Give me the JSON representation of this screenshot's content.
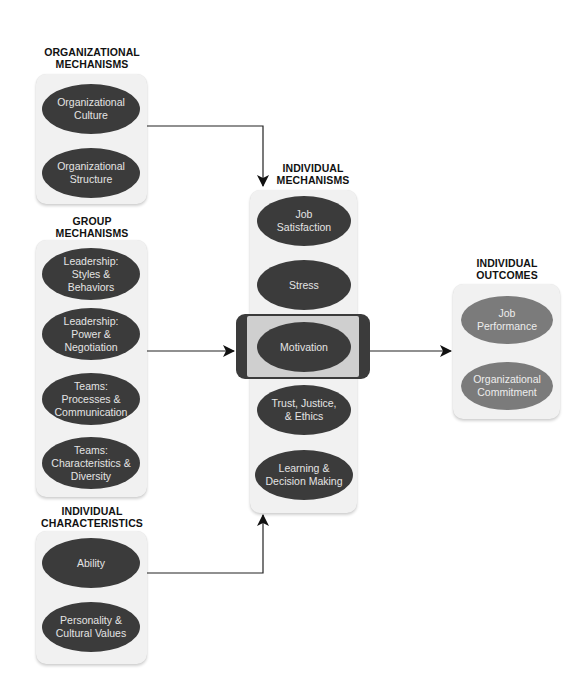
{
  "diagram": {
    "colors": {
      "dark_node": "#3b3b3b",
      "light_node": "#7b7b7b",
      "panel": "#f1f1f1",
      "highlight_band": "#cfcfcf",
      "arrow": "#111111"
    },
    "groups": {
      "organizational": {
        "heading_line1": "ORGANIZATIONAL",
        "heading_line2": "MECHANISMS",
        "nodes": [
          {
            "line1": "Organizational",
            "line2": "Culture"
          },
          {
            "line1": "Organizational",
            "line2": "Structure"
          }
        ]
      },
      "group": {
        "heading_line1": "GROUP",
        "heading_line2": "MECHANISMS",
        "nodes": [
          {
            "line1": "Leadership:",
            "line2": "Styles &",
            "line3": "Behaviors"
          },
          {
            "line1": "Leadership:",
            "line2": "Power &",
            "line3": "Negotiation"
          },
          {
            "line1": "Teams:",
            "line2": "Processes &",
            "line3": "Communication"
          },
          {
            "line1": "Teams:",
            "line2": "Characteristics &",
            "line3": "Diversity"
          }
        ]
      },
      "individual_characteristics": {
        "heading_line1": "INDIVIDUAL",
        "heading_line2": "CHARACTERISTICS",
        "nodes": [
          {
            "line1": "Ability"
          },
          {
            "line1": "Personality &",
            "line2": "Cultural Values"
          }
        ]
      },
      "individual_mechanisms": {
        "heading_line1": "INDIVIDUAL",
        "heading_line2": "MECHANISMS",
        "highlighted": "Motivation",
        "nodes": [
          {
            "line1": "Job",
            "line2": "Satisfaction"
          },
          {
            "line1": "Stress"
          },
          {
            "line1": "Motivation"
          },
          {
            "line1": "Trust, Justice,",
            "line2": "& Ethics"
          },
          {
            "line1": "Learning &",
            "line2": "Decision Making"
          }
        ]
      },
      "individual_outcomes": {
        "heading_line1": "INDIVIDUAL",
        "heading_line2": "OUTCOMES",
        "nodes": [
          {
            "line1": "Job",
            "line2": "Performance"
          },
          {
            "line1": "Organizational",
            "line2": "Commitment"
          }
        ]
      }
    },
    "edges": [
      {
        "from": "organizational",
        "to": "individual_mechanisms"
      },
      {
        "from": "group",
        "to": "individual_mechanisms"
      },
      {
        "from": "individual_characteristics",
        "to": "individual_mechanisms"
      },
      {
        "from": "individual_mechanisms",
        "to": "individual_outcomes"
      }
    ]
  }
}
